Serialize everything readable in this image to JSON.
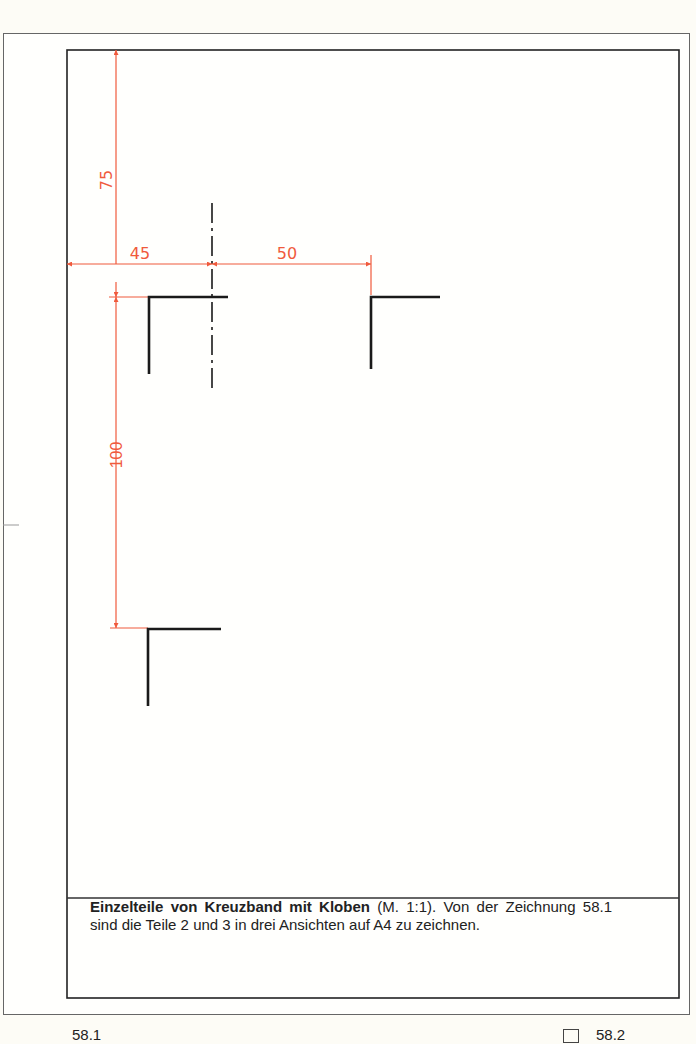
{
  "figure": {
    "caption_bold": "Einzelteile von Kreuzband mit Kloben",
    "caption_rest": " (M. 1:1). Von der Zeichnung 58.1 sind die Teile 2 und 3 in drei Ansichten auf A4 zu zeichnen.",
    "footer_left": "58.1",
    "footer_right": "58.2"
  },
  "dimensions": {
    "top_offset": "75",
    "left_offset": "45",
    "horizontal_spacing": "50",
    "vertical_spacing": "100"
  },
  "colors": {
    "dimension_line": "#f05a3c",
    "outline": "#1a1a1a",
    "frame": "#333333",
    "paper": "#fffffd"
  }
}
